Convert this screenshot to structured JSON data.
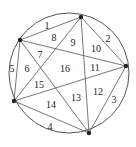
{
  "diagram": {
    "type": "circle-chord-regions",
    "circle": {
      "cx": 69,
      "cy": 73,
      "r": 60
    },
    "points": [
      {
        "id": "A",
        "x": 81,
        "y": 17
      },
      {
        "id": "B",
        "x": 126,
        "y": 66
      },
      {
        "id": "C",
        "x": 89,
        "y": 133
      },
      {
        "id": "D",
        "x": 14,
        "y": 101
      },
      {
        "id": "E",
        "x": 20,
        "y": 40
      }
    ],
    "chords": [
      [
        "A",
        "B"
      ],
      [
        "A",
        "C"
      ],
      [
        "A",
        "D"
      ],
      [
        "A",
        "E"
      ],
      [
        "B",
        "C"
      ],
      [
        "B",
        "D"
      ],
      [
        "B",
        "E"
      ],
      [
        "C",
        "D"
      ],
      [
        "C",
        "E"
      ],
      [
        "D",
        "E"
      ]
    ],
    "line_color": "#555555",
    "point_color": "#222222",
    "regions": [
      {
        "label": "1",
        "x": 47,
        "y": 25
      },
      {
        "label": "2",
        "x": 108,
        "y": 38
      },
      {
        "label": "3",
        "x": 114,
        "y": 99
      },
      {
        "label": "4",
        "x": 50,
        "y": 126
      },
      {
        "label": "5",
        "x": 12,
        "y": 68
      },
      {
        "label": "6",
        "x": 27,
        "y": 68
      },
      {
        "label": "7",
        "x": 40,
        "y": 54
      },
      {
        "label": "8",
        "x": 54,
        "y": 37
      },
      {
        "label": "9",
        "x": 73,
        "y": 42
      },
      {
        "label": "10",
        "x": 96,
        "y": 48
      },
      {
        "label": "11",
        "x": 95,
        "y": 67
      },
      {
        "label": "12",
        "x": 98,
        "y": 91
      },
      {
        "label": "13",
        "x": 76,
        "y": 97
      },
      {
        "label": "14",
        "x": 51,
        "y": 104
      },
      {
        "label": "15",
        "x": 39,
        "y": 84
      },
      {
        "label": "16",
        "x": 65,
        "y": 68
      }
    ]
  }
}
